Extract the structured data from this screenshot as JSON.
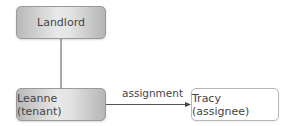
{
  "diagram": {
    "nodes": [
      {
        "id": "landlord",
        "label": "Landlord",
        "style": "grey"
      },
      {
        "id": "leanne",
        "label": "Leanne (tenant)",
        "style": "grey"
      },
      {
        "id": "tracy",
        "label": "Tracy (assignee)",
        "style": "white"
      }
    ],
    "edges": [
      {
        "from": "landlord",
        "to": "leanne",
        "label": "",
        "arrow": false
      },
      {
        "from": "leanne",
        "to": "tracy",
        "label": "assignment",
        "arrow": true
      }
    ]
  },
  "colors": {
    "line": "#555555",
    "node_border": "#9a9a9a"
  }
}
